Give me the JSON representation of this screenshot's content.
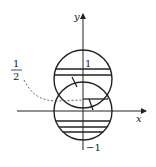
{
  "diagram": {
    "axes": {
      "x_label": "x",
      "y_label": "y"
    },
    "ticks": {
      "y_top": "1",
      "y_bottom": "−1"
    },
    "annotation": {
      "numerator": "1",
      "denominator": "2"
    },
    "colors": {
      "stroke": "#222222",
      "dashed": "#555555",
      "background": "#ffffff"
    }
  }
}
